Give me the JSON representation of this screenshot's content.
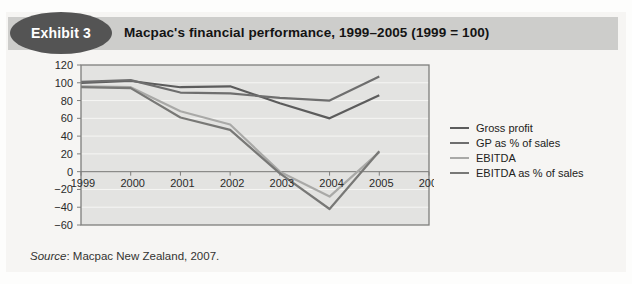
{
  "exhibit": {
    "badge": "Exhibit 3",
    "title": "Macpac's financial performance, 1999–2005 (1999 = 100)"
  },
  "source": {
    "label": "Source",
    "rest": ": Macpac New Zealand, 2007."
  },
  "colors": {
    "panel_bg": "#f6f5f3",
    "header_band": "#cdcdcb",
    "badge_bg": "#545454",
    "plot_bg": "#e3e3e1",
    "gridline": "#f6f6f4",
    "plot_border": "#7e7e7c",
    "zero_axis": "#8b8b89"
  },
  "chart_data": {
    "type": "line",
    "title": "Macpac's financial performance, 1999–2005 (1999 = 100)",
    "x": [
      1999,
      2000,
      2001,
      2002,
      2003,
      2004,
      2005
    ],
    "x_axis_ticks": [
      1999,
      2000,
      2001,
      2002,
      2003,
      2004,
      2005,
      2006
    ],
    "ylim": [
      -60,
      120
    ],
    "y_tick_step": 20,
    "grid": true,
    "legend_position": "right",
    "series": [
      {
        "name": "Gross profit",
        "color": "#5c5c5c",
        "values": [
          100,
          102,
          95,
          96,
          77,
          60,
          86
        ]
      },
      {
        "name": "GP as % of sales",
        "color": "#6e6e6e",
        "values": [
          101,
          103,
          89,
          88,
          83,
          80,
          107
        ]
      },
      {
        "name": "EBITDA",
        "color": "#a9a9a7",
        "values": [
          96,
          95,
          68,
          53,
          0,
          -28,
          22
        ]
      },
      {
        "name": "EBITDA as % of sales",
        "color": "#787876",
        "values": [
          95,
          94,
          61,
          47,
          -2,
          -42,
          23
        ]
      }
    ]
  }
}
